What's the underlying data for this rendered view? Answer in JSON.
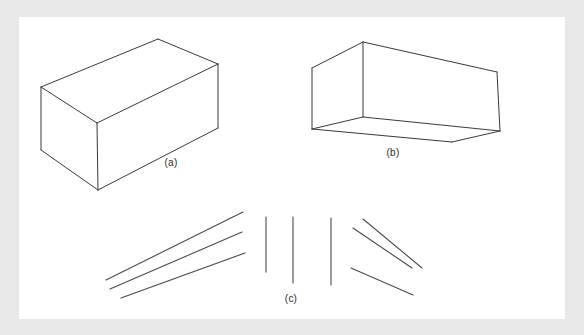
{
  "figure": {
    "background_color": "#ffffff",
    "frame_color": "#e8e8e8",
    "ink_color": "#3a3a3a",
    "canvas": {
      "x": 19,
      "y": 17,
      "width": 546,
      "height": 302
    },
    "panels": [
      {
        "id": "panel-a",
        "label": "(a)",
        "label_position": {
          "x": 171,
          "y": 162
        },
        "type": "wireframe-box",
        "description": "rectangular box drawn in outline, seen from above-left",
        "vertices": {
          "top_back": {
            "x": 158,
            "y": 39
          },
          "top_right": {
            "x": 218,
            "y": 64
          },
          "top_left": {
            "x": 41,
            "y": 87
          },
          "top_front": {
            "x": 97,
            "y": 123
          },
          "bottom_left": {
            "x": 41,
            "y": 150
          },
          "bottom_front": {
            "x": 98,
            "y": 190
          },
          "bottom_right": {
            "x": 218,
            "y": 128
          }
        },
        "edges": [
          [
            "top_left",
            "top_back"
          ],
          [
            "top_back",
            "top_right"
          ],
          [
            "top_right",
            "top_front"
          ],
          [
            "top_front",
            "top_left"
          ],
          [
            "top_left",
            "bottom_left"
          ],
          [
            "top_front",
            "bottom_front"
          ],
          [
            "top_right",
            "bottom_right"
          ],
          [
            "bottom_left",
            "bottom_front"
          ],
          [
            "bottom_front",
            "bottom_right"
          ]
        ]
      },
      {
        "id": "panel-b",
        "label": "(b)",
        "label_position": {
          "x": 393,
          "y": 152
        },
        "type": "wireframe-box",
        "description": "rectangular box drawn in outline, seen from below-front (hollow box interior)",
        "vertices": {
          "top_peak": {
            "x": 363,
            "y": 42
          },
          "top_left": {
            "x": 312,
            "y": 68
          },
          "top_right": {
            "x": 497,
            "y": 72
          },
          "inner_center": {
            "x": 363,
            "y": 117
          },
          "bottom_left": {
            "x": 312,
            "y": 129
          },
          "bottom_right": {
            "x": 500,
            "y": 131
          },
          "bottom_front": {
            "x": 452,
            "y": 142
          }
        },
        "edges": [
          [
            "top_left",
            "top_peak"
          ],
          [
            "top_peak",
            "top_right"
          ],
          [
            "top_peak",
            "inner_center"
          ],
          [
            "top_left",
            "bottom_left"
          ],
          [
            "top_right",
            "bottom_right"
          ],
          [
            "inner_center",
            "bottom_left"
          ],
          [
            "inner_center",
            "bottom_right"
          ],
          [
            "bottom_left",
            "bottom_front"
          ],
          [
            "bottom_front",
            "bottom_right"
          ]
        ]
      },
      {
        "id": "panel-c",
        "label": "(c)",
        "label_position": {
          "x": 291,
          "y": 298
        },
        "type": "line-segments",
        "description": "nine separate straight line segments: three converging from lower-left, three vertical in the middle, three descending at the right",
        "groups": [
          {
            "name": "left-converging-lines",
            "lines": [
              {
                "x1": 106,
                "y1": 280,
                "x2": 243,
                "y2": 212
              },
              {
                "x1": 110,
                "y1": 289,
                "x2": 242,
                "y2": 232
              },
              {
                "x1": 121,
                "y1": 298,
                "x2": 245,
                "y2": 253
              }
            ]
          },
          {
            "name": "center-vertical-lines",
            "lines": [
              {
                "x1": 266,
                "y1": 217,
                "x2": 266,
                "y2": 272
              },
              {
                "x1": 293,
                "y1": 217,
                "x2": 293,
                "y2": 283
              },
              {
                "x1": 331,
                "y1": 218,
                "x2": 331,
                "y2": 285
              }
            ]
          },
          {
            "name": "right-descending-lines",
            "lines": [
              {
                "x1": 363,
                "y1": 219,
                "x2": 422,
                "y2": 268
              },
              {
                "x1": 353,
                "y1": 228,
                "x2": 412,
                "y2": 268
              },
              {
                "x1": 351,
                "y1": 268,
                "x2": 413,
                "y2": 295
              }
            ]
          }
        ]
      }
    ]
  }
}
